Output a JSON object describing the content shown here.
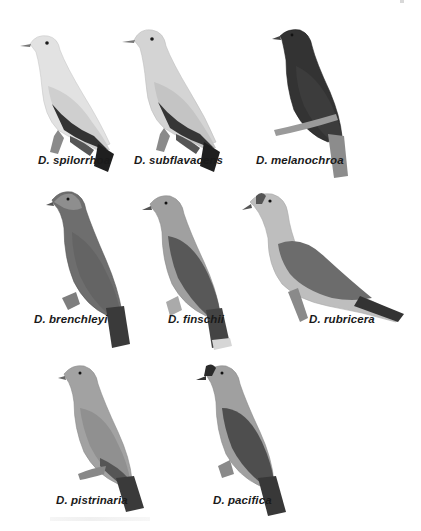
{
  "figure": {
    "genus_abbrev": "D.",
    "species": [
      {
        "label": "D. spilorrhoa",
        "row": 1,
        "head": "#e6e6e6",
        "body": "#dcdcdc",
        "wing": "#d0d0d0",
        "flight": "#3a3a3a",
        "tail": "#222222"
      },
      {
        "label": "D. subflavacens",
        "row": 1,
        "head": "#d8d8d8",
        "body": "#cfcfcf",
        "wing": "#c4c4c4",
        "flight": "#3e3e3e",
        "tail": "#222222"
      },
      {
        "label": "D. melanochroa",
        "row": 1,
        "head": "#2c2c2c",
        "body": "#333333",
        "wing": "#3a3a3a",
        "flight": "#2e2e2e",
        "tail": "#8a8a8a"
      },
      {
        "label": "D. brenchleyi",
        "row": 2,
        "head": "#8c8c8c",
        "body": "#6a6a6a",
        "wing": "#646464",
        "flight": "#4e4e4e",
        "tail": "#3c3c3c"
      },
      {
        "label": "D. finschii",
        "row": 2,
        "head": "#a6a6a6",
        "body": "#9a9a9a",
        "wing": "#5a5a5a",
        "flight": "#4a4a4a",
        "tail": "#444444"
      },
      {
        "label": "D. rubricera",
        "row": 2,
        "head": "#c4c4c4",
        "body": "#bcbcbc",
        "wing": "#6e6e6e",
        "flight": "#4c4c4c",
        "tail": "#333333"
      },
      {
        "label": "D. pistrinaria",
        "row": 3,
        "head": "#a8a8a8",
        "body": "#9c9c9c",
        "wing": "#8e8e8e",
        "flight": "#505050",
        "tail": "#3a3a3a"
      },
      {
        "label": "D. pacifica",
        "row": 3,
        "head": "#a4a4a4",
        "body": "#9a9a9a",
        "wing": "#4e4e4e",
        "flight": "#444444",
        "tail": "#383838"
      }
    ]
  }
}
